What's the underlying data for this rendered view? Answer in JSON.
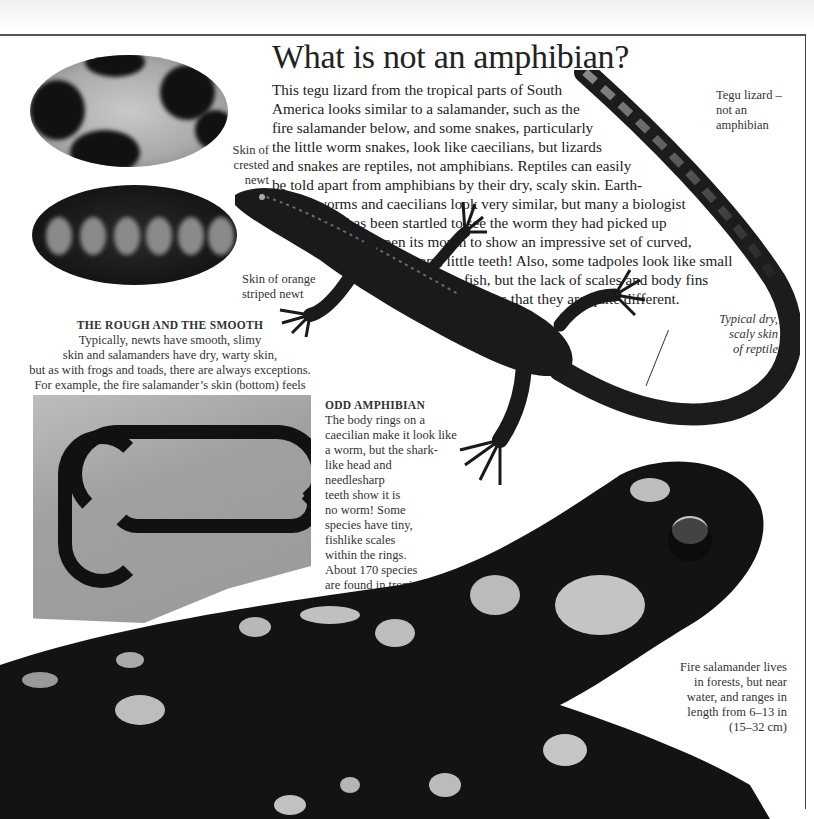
{
  "page": {
    "title": "What is not an amphibian?",
    "intro_lines": [
      "This tegu lizard from the tropical parts of South",
      "America looks similar to a salamander, such as the",
      "fire salamander below, and some snakes, particularly",
      "the little worm snakes, look like caecilians, but lizards",
      "and snakes are reptiles, not amphibians. Reptiles can easily",
      "be told apart from amphibians by their dry, scaly skin. Earth-",
      "worms and caecilians look very similar, but many a biologist",
      "has been startled to see the worm they had picked up",
      "open its mouth to show an impressive set of curved,",
      "sharp, little teeth! Also, some tadpoles look like small",
      "fish, but the lack of scales and body fins",
      "shows that they are quite different."
    ]
  },
  "captions": {
    "tegu": [
      "Tegu lizard –",
      "not an",
      "amphibian"
    ],
    "crested_newt": [
      "Skin of",
      "crested",
      "newt"
    ],
    "orange_newt": [
      "Skin of orange",
      "striped newt"
    ],
    "rough_smooth": {
      "heading": "THE ROUGH AND THE SMOOTH",
      "lines": [
        "Typically, newts have smooth, slimy",
        "skin and salamanders have dry, warty skin,",
        "but as with frogs and toads, there are always exceptions.",
        "For example, the fire salamander’s skin (bottom) feels",
        "smooth and damp."
      ]
    },
    "reptile_skin": [
      "Typical dry,",
      "scaly skin",
      "of reptile"
    ],
    "odd_amphibian": {
      "heading": "ODD AMPHIBIAN",
      "lines": [
        "The body rings on a",
        "caecilian make it look like",
        "a worm, but the shark-",
        "like head and",
        "needlesharp",
        "teeth show it is",
        "no worm! Some",
        "species have tiny,",
        "fishlike scales",
        "within the rings.",
        "About 170 species",
        "are found in tropical",
        "parts of the world."
      ]
    },
    "fire_salamander": [
      "Fire salamander lives",
      "in forests, but near",
      "water, and ranges in",
      "length from 6–13 in",
      "(15–32 cm)"
    ]
  },
  "images": {
    "crested_newt_skin": "crested newt skin close-up",
    "orange_newt_skin": "orange striped newt skin close-up",
    "tegu_lizard": "tegu lizard photo",
    "caecilian": "caecilian on leaf photo",
    "fire_salamander": "fire salamander photo"
  }
}
